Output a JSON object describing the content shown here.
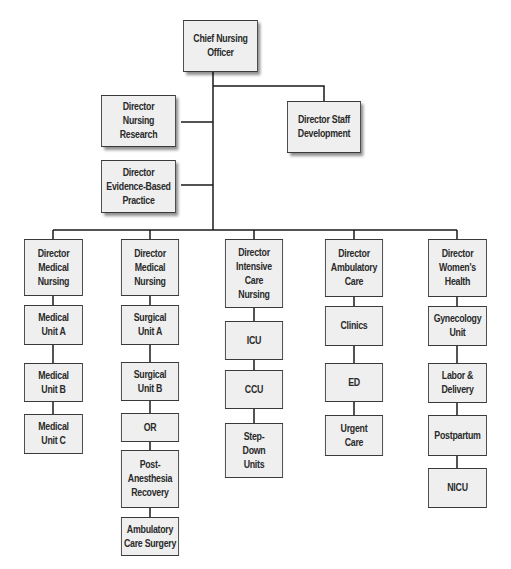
{
  "chart": {
    "root": {
      "label": "Chief Nursing\nOfficer"
    },
    "staff_reports": [
      {
        "label": "Director\nNursing Research"
      },
      {
        "label": "Director\nEvidence-Based\nPractice"
      },
      {
        "label": "Director Staff\nDevelopment"
      }
    ],
    "divisions": [
      {
        "director": "Director\nMedical\nNursing",
        "units": [
          "Medical\nUnit A",
          "Medical\nUnit B",
          "Medical\nUnit C"
        ]
      },
      {
        "director": "Director\nMedical\nNursing",
        "units": [
          "Surgical\nUnit A",
          "Surgical\nUnit B",
          "OR",
          "Post-\nAnesthesia\nRecovery",
          "Ambulatory\nCare Surgery"
        ]
      },
      {
        "director": "Director\nIntensive\nCare\nNursing",
        "units": [
          "ICU",
          "CCU",
          "Step-\nDown\nUnits"
        ]
      },
      {
        "director": "Director\nAmbulatory\nCare",
        "units": [
          "Clinics",
          "ED",
          "Urgent\nCare"
        ]
      },
      {
        "director": "Director\nWomen's\nHealth",
        "units": [
          "Gynecology\nUnit",
          "Labor &\nDelivery",
          "Postpartum",
          "NICU"
        ]
      }
    ]
  },
  "colors": {
    "box_fill": "#efefef",
    "box_border": "#3a3a3a",
    "line": "#1a1a1a",
    "text": "#2a2a2a"
  }
}
